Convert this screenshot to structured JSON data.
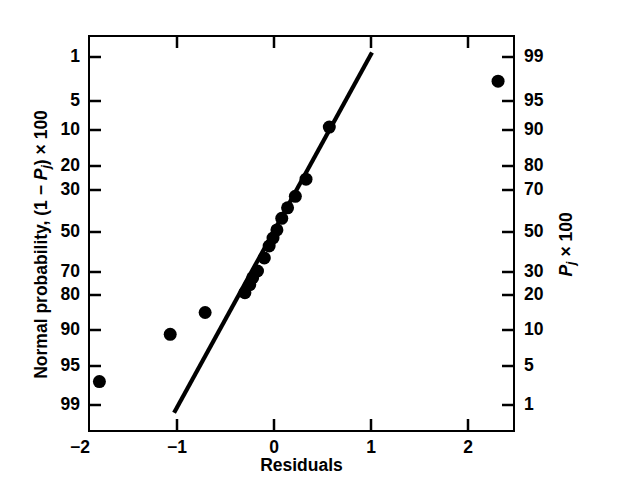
{
  "chart_data": {
    "type": "scatter",
    "title": "",
    "xlabel": "Residuals",
    "ylabel_left": "Normal probability, (1 − Pj) × 100",
    "ylabel_right": "Pj × 100",
    "grid": false,
    "legend": "none",
    "xlim": [
      -1.92,
      2.48
    ],
    "xticks": [
      -2,
      -1,
      0,
      1,
      2
    ],
    "xticklabels": [
      "−2",
      "−1",
      "0",
      "1",
      "2"
    ],
    "left_axis_scale": "normal-probability",
    "yticks_left": [
      1,
      5,
      10,
      20,
      30,
      50,
      70,
      80,
      90,
      95,
      99
    ],
    "yticklabels_left": [
      "1",
      "5",
      "10",
      "20",
      "30",
      "50",
      "70",
      "80",
      "90",
      "95",
      "99"
    ],
    "yticks_right": [
      99,
      95,
      90,
      80,
      70,
      50,
      30,
      20,
      10,
      5,
      1
    ],
    "yticklabels_right": [
      "99",
      "95",
      "90",
      "80",
      "70",
      "50",
      "30",
      "20",
      "10",
      "5",
      "1"
    ],
    "points": [
      {
        "x": -1.8,
        "p_left": 96.6
      },
      {
        "x": -1.07,
        "p_left": 90.6
      },
      {
        "x": -0.71,
        "p_left": 85.0
      },
      {
        "x": -0.3,
        "p_left": 79.0
      },
      {
        "x": -0.25,
        "p_left": 75.5
      },
      {
        "x": -0.22,
        "p_left": 72.5
      },
      {
        "x": -0.17,
        "p_left": 69.5
      },
      {
        "x": -0.1,
        "p_left": 63.0
      },
      {
        "x": -0.05,
        "p_left": 57.0
      },
      {
        "x": -0.01,
        "p_left": 53.0
      },
      {
        "x": 0.03,
        "p_left": 49.0
      },
      {
        "x": 0.08,
        "p_left": 43.5
      },
      {
        "x": 0.14,
        "p_left": 38.5
      },
      {
        "x": 0.22,
        "p_left": 33.0
      },
      {
        "x": 0.33,
        "p_left": 25.5
      },
      {
        "x": 0.57,
        "p_left": 9.5
      },
      {
        "x": 2.31,
        "p_left": 3.2
      }
    ],
    "reference_line": {
      "x_start": -1.03,
      "p_start": 99.8,
      "x_end": 1.01,
      "p_end": 0.6
    },
    "marker": {
      "shape": "circle",
      "size_px": 13,
      "color": "#000000"
    },
    "line_color": "#000000",
    "line_width_px": 4.2,
    "frame_color": "#000000",
    "background": "#FFFFFF"
  },
  "axes": {
    "left_ticks": [
      {
        "label": "1",
        "y": 57
      },
      {
        "label": "5",
        "y": 101
      },
      {
        "label": "10",
        "y": 130
      },
      {
        "label": "20",
        "y": 166
      },
      {
        "label": "30",
        "y": 190
      },
      {
        "label": "50",
        "y": 232
      },
      {
        "label": "70",
        "y": 272
      },
      {
        "label": "80",
        "y": 295
      },
      {
        "label": "90",
        "y": 330
      },
      {
        "label": "95",
        "y": 366
      },
      {
        "label": "99",
        "y": 405
      }
    ],
    "right_ticks": [
      {
        "label": "99",
        "y": 57
      },
      {
        "label": "95",
        "y": 101
      },
      {
        "label": "90",
        "y": 130
      },
      {
        "label": "80",
        "y": 166
      },
      {
        "label": "70",
        "y": 190
      },
      {
        "label": "50",
        "y": 232
      },
      {
        "label": "30",
        "y": 272
      },
      {
        "label": "20",
        "y": 295
      },
      {
        "label": "10",
        "y": 330
      },
      {
        "label": "5",
        "y": 366
      },
      {
        "label": "1",
        "y": 405
      }
    ],
    "bottom_ticks": [
      {
        "label": "−2",
        "x": 80
      },
      {
        "label": "−1",
        "x": 177
      },
      {
        "label": "0",
        "x": 274
      },
      {
        "label": "1",
        "x": 371
      },
      {
        "label": "2",
        "x": 468
      }
    ]
  },
  "labels": {
    "xaxis_title": "Residuals",
    "yaxis_left_prefix": "Normal probability, (1 − ",
    "yaxis_left_var": "P",
    "yaxis_left_sub": "j",
    "yaxis_left_suffix": ") × 100",
    "yaxis_right_var": "P",
    "yaxis_right_sub": "j",
    "yaxis_right_suffix": " × 100"
  }
}
